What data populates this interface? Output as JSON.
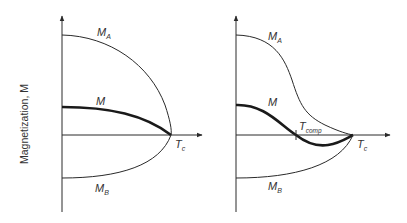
{
  "y_axis_label": "Magnetization, M",
  "colors": {
    "line": "#2a2a2a",
    "text": "#333333",
    "background": "#ffffff"
  },
  "panels": [
    {
      "name": "ferrimagnet-without-compensation",
      "curves": {
        "sublattice_a": {
          "label": "M",
          "subscript": "A"
        },
        "net": {
          "label": "M",
          "subscript": ""
        },
        "sublattice_b": {
          "label": "M",
          "subscript": "B"
        }
      },
      "curie_label": {
        "label": "T",
        "subscript": "c"
      }
    },
    {
      "name": "ferrimagnet-with-compensation",
      "curves": {
        "sublattice_a": {
          "label": "M",
          "subscript": "A"
        },
        "net": {
          "label": "M",
          "subscript": ""
        },
        "sublattice_b": {
          "label": "M",
          "subscript": "B"
        }
      },
      "compensation_label": {
        "label": "T",
        "subscript": "comp"
      },
      "curie_label": {
        "label": "T",
        "subscript": "c"
      }
    }
  ]
}
